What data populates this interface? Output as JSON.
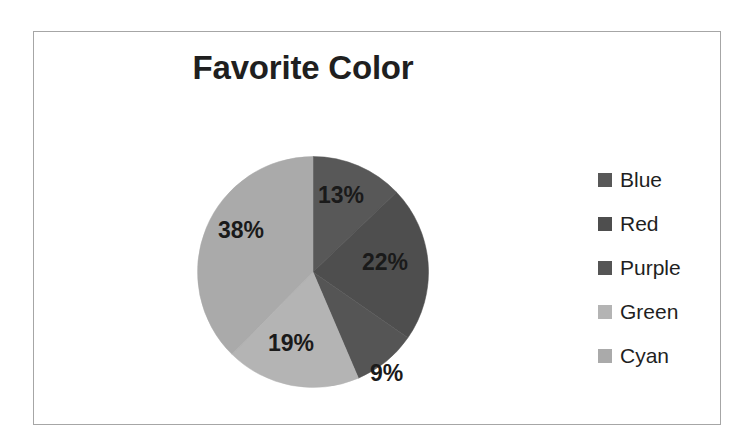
{
  "frame": {
    "border_color": "#a6a6a6",
    "background": "#ffffff"
  },
  "title": "Favorite Color",
  "legend": {
    "position": "right",
    "items": [
      {
        "label": "Blue",
        "swatch": "#585858"
      },
      {
        "label": "Red",
        "swatch": "#4e4e4e"
      },
      {
        "label": "Purple",
        "swatch": "#555555"
      },
      {
        "label": "Green",
        "swatch": "#b4b4b4"
      },
      {
        "label": "Cyan",
        "swatch": "#aaaaaa"
      }
    ]
  },
  "labels": {
    "blue": "13%",
    "red": "22%",
    "purple": "9%",
    "green": "19%",
    "cyan": "38%"
  },
  "chart_data": {
    "type": "pie",
    "title": "Favorite Color",
    "categories": [
      "Blue",
      "Red",
      "Purple",
      "Green",
      "Cyan"
    ],
    "values": [
      13,
      22,
      9,
      19,
      38
    ],
    "value_labels": [
      "13%",
      "22%",
      "9%",
      "19%",
      "38%"
    ],
    "units": "percent",
    "total": 101,
    "colors": [
      "#585858",
      "#4e4e4e",
      "#555555",
      "#b4b4b4",
      "#aaaaaa"
    ],
    "start_angle_deg": 0,
    "direction": "clockwise",
    "legend": "right",
    "grid": false,
    "xlabel": "",
    "ylabel": ""
  }
}
